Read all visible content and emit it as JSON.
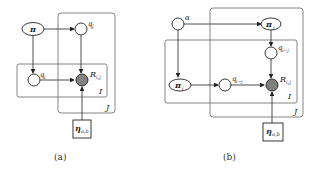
{
  "figures": [
    {
      "caption": "(a)",
      "nodes": {
        "pi": "π",
        "q_j": "q",
        "q_j_sub": "j",
        "q_i": "q",
        "q_i_sub": "i",
        "R": "R",
        "R_sub": "i,j",
        "eta": "η",
        "eta_sub": "a,b"
      },
      "plates": {
        "inner": "I",
        "outer": "J"
      }
    },
    {
      "caption": "(b)",
      "nodes": {
        "alpha": "α",
        "pi_j": "π",
        "pi_j_sub": "j",
        "q_ij_in": "q",
        "q_ij_in_sub": "i←j",
        "pi_i": "π",
        "pi_i_sub": "i",
        "q_ij_out": "q",
        "q_ij_out_sub": "i→j",
        "R": "R",
        "R_sub": "i,j",
        "eta": "η",
        "eta_sub": "a,b"
      },
      "plates": {
        "inner": "I",
        "outer": "J"
      }
    }
  ],
  "colors": {
    "stroke": "#222222",
    "plate": "#555555",
    "observed": "#808080"
  }
}
